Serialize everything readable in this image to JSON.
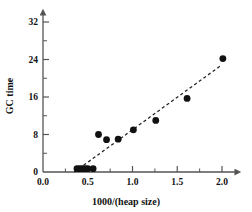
{
  "chart_data": {
    "type": "scatter",
    "title": "",
    "xlabel": "1000/(heap size)",
    "ylabel": "GC time",
    "xlim": [
      0.0,
      2.1
    ],
    "ylim": [
      0,
      33
    ],
    "grid": false,
    "legend": null,
    "xticks": [
      0.0,
      0.5,
      1.0,
      1.5,
      2.0
    ],
    "xticklabels": [
      "0.0",
      "0.5",
      "1.0",
      "1.5",
      "2.0"
    ],
    "xminorticks": [
      0.25,
      0.75,
      1.25,
      1.75
    ],
    "yticks": [
      0,
      8,
      16,
      24,
      32
    ],
    "yticklabels": [
      "0",
      "8",
      "16",
      "24",
      "32"
    ],
    "yminorticks": [
      4,
      12,
      20,
      28
    ],
    "points": [
      {
        "x": 0.38,
        "y": 0.7
      },
      {
        "x": 0.41,
        "y": 0.7
      },
      {
        "x": 0.44,
        "y": 0.7
      },
      {
        "x": 0.47,
        "y": 0.7
      },
      {
        "x": 0.5,
        "y": 0.7
      },
      {
        "x": 0.56,
        "y": 0.7
      },
      {
        "x": 0.62,
        "y": 8.0
      },
      {
        "x": 0.71,
        "y": 6.9
      },
      {
        "x": 0.84,
        "y": 7.0
      },
      {
        "x": 1.01,
        "y": 9.0
      },
      {
        "x": 1.26,
        "y": 11.0
      },
      {
        "x": 1.61,
        "y": 15.7
      },
      {
        "x": 2.01,
        "y": 24.2
      }
    ],
    "trendline": {
      "style": "dashed",
      "x0": 0.35,
      "y0": 0.0,
      "x1": 1.98,
      "y1": 22.6
    },
    "marker": {
      "shape": "circle",
      "color": "#111111",
      "size": 3.4
    },
    "axis_color": "#555555",
    "line_color": "#222222"
  },
  "axis_titles": {
    "x": "1000/(heap size)",
    "y": "GC time"
  }
}
